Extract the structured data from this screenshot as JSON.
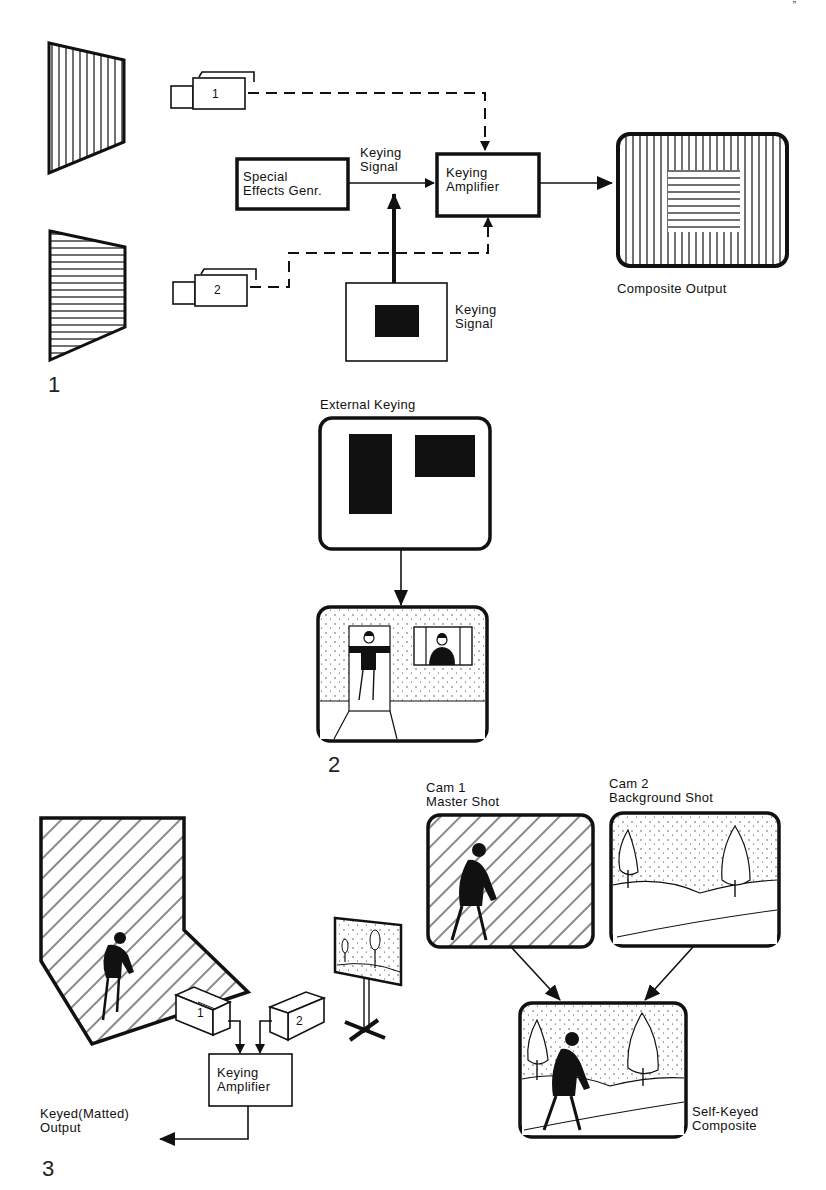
{
  "page": {
    "corner_mark": "”"
  },
  "figure1": {
    "number": "1",
    "camera1_label": "1",
    "camera2_label": "2",
    "sfx_generator": {
      "line1": "Special",
      "line2": "Effects Genr."
    },
    "keying_signal_top": {
      "line1": "Keying",
      "line2": "Signal"
    },
    "keying_amplifier": {
      "line1": "Keying",
      "line2": "Amplifier"
    },
    "keying_signal_bottom": {
      "line1": "Keying",
      "line2": "Signal"
    },
    "composite_output": "Composite Output"
  },
  "figure2": {
    "number": "2",
    "title": "External Keying"
  },
  "figure3": {
    "number": "3",
    "camera1_label": "1",
    "camera2_label": "2",
    "keying_amplifier": {
      "line1": "Keying",
      "line2": "Amplifier"
    },
    "keyed_output": {
      "line1": "Keyed(Matted)",
      "line2": "Output"
    },
    "cam1": {
      "line1": "Cam 1",
      "line2": "Master Shot"
    },
    "cam2": {
      "line1": "Cam 2",
      "line2": "Background Shot"
    },
    "self_keyed": {
      "line1": "Self-Keyed",
      "line2": "Composite"
    }
  },
  "colors": {
    "ink": "#111111",
    "paper": "#ffffff"
  }
}
